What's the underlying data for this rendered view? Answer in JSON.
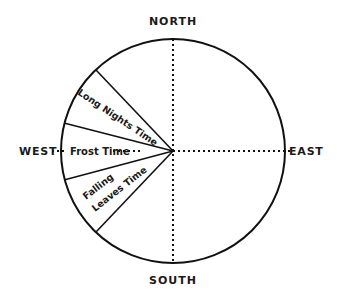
{
  "diagram": {
    "directions": {
      "north": "NORTH",
      "south": "SOUTH",
      "east": "EAST",
      "west": "WEST"
    },
    "segments": [
      {
        "label": "Long Nights Time"
      },
      {
        "label": "Frost Time"
      },
      {
        "label_line1": "Falling",
        "label_line2": "Leaves Time"
      }
    ],
    "colors": {
      "stroke": "#111111",
      "text": "#1a1a1a",
      "background": "#ffffff"
    }
  }
}
